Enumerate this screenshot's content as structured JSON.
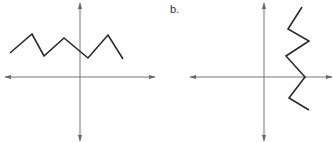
{
  "graphs": [
    {
      "id": "a",
      "label": "",
      "axes": {
        "origin": [
          80,
          77
        ],
        "x_range": [
          5,
          155
        ],
        "y_range": [
          3,
          141
        ]
      },
      "polyline": [
        [
          10,
          53
        ],
        [
          32,
          34
        ],
        [
          44,
          56
        ],
        [
          64,
          38
        ],
        [
          88,
          58
        ],
        [
          108,
          35
        ],
        [
          123,
          59
        ]
      ]
    },
    {
      "id": "b",
      "label": "b.",
      "axes": {
        "origin": [
          264,
          77
        ],
        "x_range": [
          190,
          332
        ],
        "y_range": [
          3,
          141
        ]
      },
      "polyline": [
        [
          302,
          7
        ],
        [
          288,
          29
        ],
        [
          309,
          41
        ],
        [
          286,
          56
        ],
        [
          305,
          77
        ],
        [
          289,
          98
        ],
        [
          309,
          110
        ]
      ]
    }
  ],
  "colors": {
    "axis": "#777777",
    "curve": "#2a2a2a",
    "label": "#333333"
  }
}
